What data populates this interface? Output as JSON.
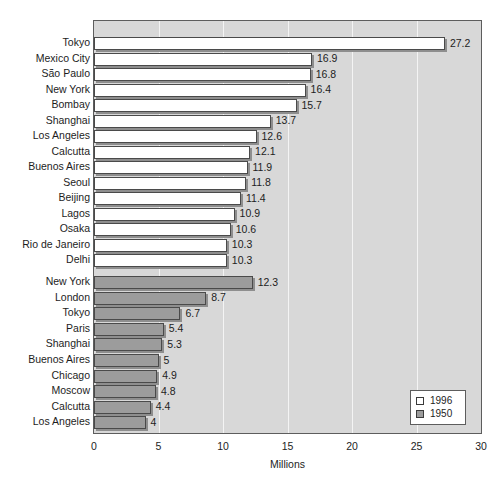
{
  "chart_data": {
    "type": "bar",
    "orientation": "horizontal",
    "title": "",
    "xlabel": "Millions",
    "ylabel": "",
    "xlim": [
      0,
      30
    ],
    "xticks": [
      "0",
      "5",
      "10",
      "15",
      "20",
      "25",
      "30"
    ],
    "grid": true,
    "legend_position": "bottom-right",
    "series": [
      {
        "name": "1996",
        "color": "#ffffff",
        "categories": [
          "Tokyo",
          "Mexico City",
          "São Paulo",
          "New York",
          "Bombay",
          "Shanghai",
          "Los Angeles",
          "Calcutta",
          "Buenos Aires",
          "Seoul",
          "Beijing",
          "Lagos",
          "Osaka",
          "Rio de Janeiro",
          "Delhi"
        ],
        "values": [
          27.2,
          16.9,
          16.8,
          16.4,
          15.7,
          13.7,
          12.6,
          12.1,
          11.9,
          11.8,
          11.4,
          10.9,
          10.6,
          10.3,
          10.3
        ],
        "value_labels": [
          "27.2",
          "16.9",
          "16.8",
          "16.4",
          "15.7",
          "13.7",
          "12.6",
          "12.1",
          "11.9",
          "11.8",
          "11.4",
          "10.9",
          "10.6",
          "10.3",
          "10.3"
        ]
      },
      {
        "name": "1950",
        "color": "#9c9c9c",
        "categories": [
          "New York",
          "London",
          "Tokyo",
          "Paris",
          "Shanghai",
          "Buenos Aires",
          "Chicago",
          "Moscow",
          "Calcutta",
          "Los Angeles"
        ],
        "values": [
          12.3,
          8.7,
          6.7,
          5.4,
          5.3,
          5.0,
          4.9,
          4.8,
          4.4,
          4.0
        ],
        "value_labels": [
          "12.3",
          "8.7",
          "6.7",
          "5.4",
          "5.3",
          "5",
          "4.9",
          "4.8",
          "4.4",
          "4"
        ]
      }
    ]
  },
  "legend": {
    "items": [
      {
        "label": "1996",
        "swatch": "white"
      },
      {
        "label": "1950",
        "swatch": "gray"
      }
    ]
  },
  "axis": {
    "x_title": "Millions",
    "ticks": [
      "0",
      "5",
      "10",
      "15",
      "20",
      "25",
      "30"
    ]
  },
  "colors": {
    "plot_background": "#d8d8d8",
    "gridline": "#f4f4f4",
    "bar_1996": "#ffffff",
    "bar_1950": "#9c9c9c",
    "bar_border": "#4a4a4a",
    "text": "#1d1d1d",
    "frame": "#5d5d5d"
  }
}
